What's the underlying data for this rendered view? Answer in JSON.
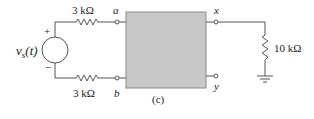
{
  "diagram": {
    "type": "circuit",
    "caption": "(c)",
    "source": {
      "label_main": "v",
      "label_sub": "s",
      "label_arg": "(t)",
      "plus": "+",
      "minus": "−"
    },
    "resistors": {
      "top": "3 kΩ",
      "bottom": "3 kΩ",
      "load": "10 kΩ"
    },
    "terminals": {
      "a": "a",
      "b": "b",
      "x": "x",
      "y": "y"
    },
    "colors": {
      "box_fill": "#c8c8c8",
      "box_stroke": "#808080",
      "wire": "#555555"
    }
  }
}
